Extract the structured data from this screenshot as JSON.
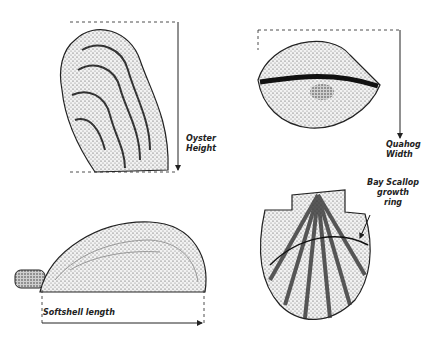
{
  "diagram": {
    "labels": {
      "oyster_line1": "Oyster",
      "oyster_line2": "Height",
      "quahog_line1": "Quahog",
      "quahog_line2": "Width",
      "softshell": "Softshell length",
      "scallop_line1": "Bay Scallop",
      "scallop_line2": "growth",
      "scallop_line3": "ring"
    },
    "shells": [
      "oyster",
      "quahog",
      "softshell clam",
      "bay scallop"
    ],
    "colors": {
      "ink": "#222222",
      "stipple": "#555555",
      "background": "#ffffff"
    }
  }
}
